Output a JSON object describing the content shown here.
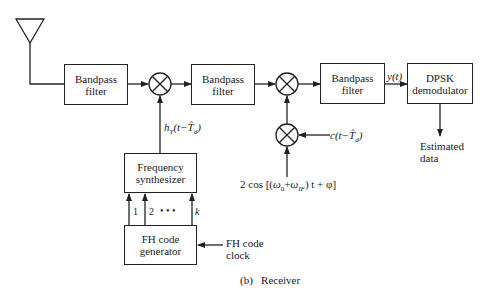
{
  "diagram": {
    "title": "(b)   Receiver",
    "blocks": {
      "bpf1": {
        "line1": "Bandpass",
        "line2": "filter"
      },
      "bpf2": {
        "line1": "Bandpass",
        "line2": "filter"
      },
      "bpf3": {
        "line1": "Bandpass",
        "line2": "filter"
      },
      "dpsk": {
        "line1": "DPSK",
        "line2": "demodulator"
      },
      "synth": {
        "line1": "Frequency",
        "line2": "synthesizer"
      },
      "fhgen": {
        "line1": "FH code",
        "line2": "generator"
      }
    },
    "labels": {
      "hop_signal": "hₜ(t−T̂d)",
      "hop_main": "h",
      "hop_sub": "T",
      "hop_arg": "(t−T̂",
      "hop_arg_sub": "d",
      "hop_close": ")",
      "y_t": "y(t)",
      "c_signal": "c(t−T̂",
      "c_sub": "d",
      "c_close": ")",
      "lo_signal": "2 cos [(ω₀+ωIF) t + φ]",
      "lo_pre": "2 cos [(",
      "lo_w0": "ω",
      "lo_w0_sub": "0",
      "lo_plus": "+",
      "lo_wif": "ω",
      "lo_wif_sub": "IF",
      "lo_post": ") t + φ]",
      "estimated": "Estimated",
      "data": "data",
      "clock1": "FH code",
      "clock2": "clock",
      "line_1": "1",
      "line_2": "2",
      "dots": "•   •   •",
      "line_k": "k"
    },
    "colors": {
      "stroke": "#222222",
      "background": "#ffffff"
    }
  }
}
